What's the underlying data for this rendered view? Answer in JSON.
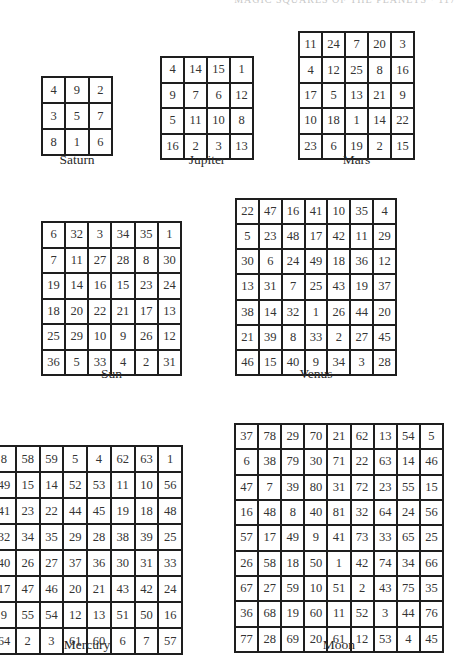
{
  "running_head": "MAGIC SQUARES OF THE PLANETS  ·  117",
  "squares": [
    {
      "name": "Saturn",
      "order": 3,
      "cells": [
        [
          4,
          9,
          2
        ],
        [
          3,
          5,
          7
        ],
        [
          8,
          1,
          6
        ]
      ]
    },
    {
      "name": "Jupiter",
      "order": 4,
      "cells": [
        [
          4,
          14,
          15,
          1
        ],
        [
          9,
          7,
          6,
          12
        ],
        [
          5,
          11,
          10,
          8
        ],
        [
          16,
          2,
          3,
          13
        ]
      ]
    },
    {
      "name": "Mars",
      "order": 5,
      "cells": [
        [
          11,
          24,
          7,
          20,
          3
        ],
        [
          4,
          12,
          25,
          8,
          16
        ],
        [
          17,
          5,
          13,
          21,
          9
        ],
        [
          10,
          18,
          1,
          14,
          22
        ],
        [
          23,
          6,
          19,
          2,
          15
        ]
      ]
    },
    {
      "name": "Sun",
      "order": 6,
      "cells": [
        [
          6,
          32,
          3,
          34,
          35,
          1
        ],
        [
          7,
          11,
          27,
          28,
          8,
          30
        ],
        [
          19,
          14,
          16,
          15,
          23,
          24
        ],
        [
          18,
          20,
          22,
          21,
          17,
          13
        ],
        [
          25,
          29,
          10,
          9,
          26,
          12
        ],
        [
          36,
          5,
          33,
          4,
          2,
          31
        ]
      ]
    },
    {
      "name": "Venus",
      "order": 7,
      "cells": [
        [
          22,
          47,
          16,
          41,
          10,
          35,
          4
        ],
        [
          5,
          23,
          48,
          17,
          42,
          11,
          29
        ],
        [
          30,
          6,
          24,
          49,
          18,
          36,
          12
        ],
        [
          13,
          31,
          7,
          25,
          43,
          19,
          37
        ],
        [
          38,
          14,
          32,
          1,
          26,
          44,
          20
        ],
        [
          21,
          39,
          8,
          33,
          2,
          27,
          45
        ],
        [
          46,
          15,
          40,
          9,
          34,
          3,
          28
        ]
      ]
    },
    {
      "name": "Mercury",
      "order": 8,
      "cells": [
        [
          8,
          58,
          59,
          5,
          4,
          62,
          63,
          1
        ],
        [
          49,
          15,
          14,
          52,
          53,
          11,
          10,
          56
        ],
        [
          41,
          23,
          22,
          44,
          45,
          19,
          18,
          48
        ],
        [
          32,
          34,
          35,
          29,
          28,
          38,
          39,
          25
        ],
        [
          40,
          26,
          27,
          37,
          36,
          30,
          31,
          33
        ],
        [
          17,
          47,
          46,
          20,
          21,
          43,
          42,
          24
        ],
        [
          9,
          55,
          54,
          12,
          13,
          51,
          50,
          16
        ],
        [
          64,
          2,
          3,
          61,
          60,
          6,
          7,
          57
        ]
      ]
    },
    {
      "name": "Moon",
      "order": 9,
      "cells": [
        [
          37,
          78,
          29,
          70,
          21,
          62,
          13,
          54,
          5
        ],
        [
          6,
          38,
          79,
          30,
          71,
          22,
          63,
          14,
          46
        ],
        [
          47,
          7,
          39,
          80,
          31,
          72,
          23,
          55,
          15
        ],
        [
          16,
          48,
          8,
          40,
          81,
          32,
          64,
          24,
          56
        ],
        [
          57,
          17,
          49,
          9,
          41,
          73,
          33,
          65,
          25
        ],
        [
          26,
          58,
          18,
          50,
          1,
          42,
          74,
          34,
          66
        ],
        [
          67,
          27,
          59,
          10,
          51,
          2,
          43,
          75,
          35
        ],
        [
          36,
          68,
          19,
          60,
          11,
          52,
          3,
          44,
          76
        ],
        [
          77,
          28,
          69,
          20,
          61,
          12,
          53,
          4,
          45
        ]
      ]
    }
  ],
  "layout": [
    {
      "left": 41,
      "top": 76,
      "size": 72,
      "cap_top": 152
    },
    {
      "left": 160,
      "top": 56,
      "size": 94,
      "cap_top": 152
    },
    {
      "left": 298,
      "top": 31,
      "size": 117,
      "cap_top": 152
    },
    {
      "left": 41,
      "top": 221,
      "size": 141,
      "cap_top": 366
    },
    {
      "left": 235,
      "top": 198,
      "size": 162,
      "cap_top": 366
    },
    {
      "left": -9,
      "top": 445,
      "size": 192,
      "cap_top": 637
    },
    {
      "left": 234,
      "top": 423,
      "size": 210,
      "cap_top": 637
    }
  ]
}
